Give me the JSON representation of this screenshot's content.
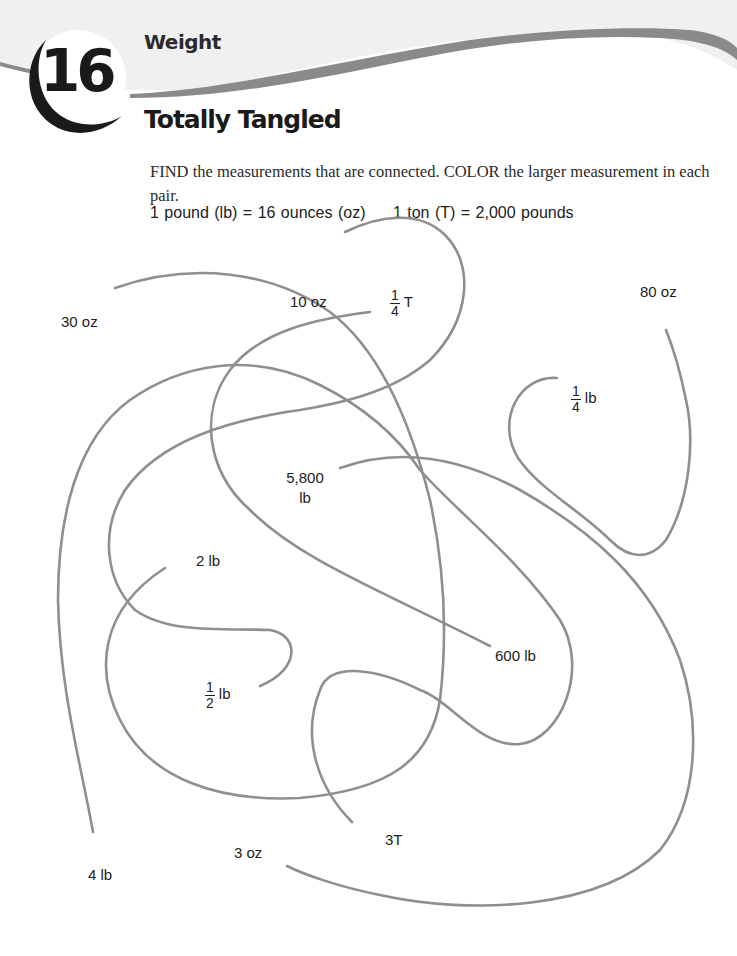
{
  "header": {
    "activity_number": "16",
    "section": "Weight",
    "title": "Totally Tangled"
  },
  "instructions": "FIND the measurements that are connected. COLOR the larger measurement in each pair.",
  "conversions": [
    "1 pound (lb) = 16 ounces (oz)",
    "1 ton (T) = 2,000 pounds"
  ],
  "labels": {
    "oz30": "30 oz",
    "oz10": "10 oz",
    "quarter_t": {
      "num": "1",
      "den": "4",
      "unit": "T"
    },
    "oz80": "80 oz",
    "quarter_lb": {
      "num": "1",
      "den": "4",
      "unit": "lb"
    },
    "lb5800_line1": "5,800",
    "lb5800_line2": "lb",
    "lb2": "2 lb",
    "lb600": "600 lb",
    "half_lb": {
      "num": "1",
      "den": "2",
      "unit": "lb"
    },
    "t3": "3T",
    "oz3": "3 oz",
    "lb4": "4 lb"
  },
  "colors": {
    "line": "#8f8f8f",
    "swoosh": "#8a8a8a",
    "header_bg": "#f0f0f0"
  }
}
